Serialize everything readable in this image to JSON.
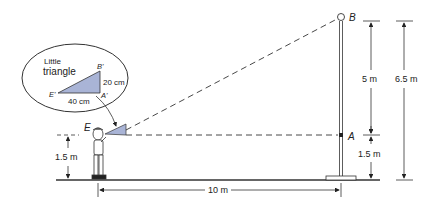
{
  "diagram": {
    "inset": {
      "title_line1": "Little",
      "title_line2": "triangle",
      "vertex_B": "B'",
      "vertex_A": "A'",
      "vertex_E": "E'",
      "side_vertical": "20 cm",
      "side_horizontal": "40 cm",
      "fill_color": "#a9b4d6"
    },
    "points": {
      "B": "B",
      "A": "A",
      "E": "E"
    },
    "dimensions": {
      "eye_height": "1.5 m",
      "pole_upper": "5 m",
      "pole_lower": "1.5 m",
      "pole_total": "6.5 m",
      "distance": "10 m"
    }
  }
}
